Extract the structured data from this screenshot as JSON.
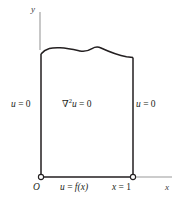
{
  "figure": {
    "type": "boundary-value-problem-diagram",
    "colors": {
      "background": "#ffffff",
      "boundary": "#231f20",
      "axis": "#9a9a9a",
      "text": "#231f20",
      "node_fill": "#ffffff"
    }
  },
  "labels": {
    "y_axis": "y",
    "x_axis": "x",
    "origin": "O",
    "left_boundary": {
      "lhs": "u",
      "op": " = ",
      "rhs": "0"
    },
    "right_boundary": {
      "lhs": "u",
      "op": " = ",
      "rhs": "0"
    },
    "interior": {
      "nabla": "∇",
      "power": "2",
      "lhs": "u",
      "op": " = ",
      "rhs": "0"
    },
    "bottom_boundary": {
      "lhs": "u",
      "op": " = ",
      "rhs": "f(x)"
    },
    "right_edge_value": {
      "lhs": "x",
      "op": " = ",
      "rhs": "1"
    }
  },
  "geometry": {
    "left_wall_x": 41,
    "right_wall_x": 133,
    "bottom_y": 177,
    "top_curve_path": "M 41 54 C 46 48, 52 47.5, 60 47.8 C 68 48.1, 74 49.6, 80 51.0 C 84 51.9, 88 51.0, 92 48.6 C 95 46.9, 98 46.6, 101 48.0 C 108 51.2, 118 55.2, 126.5 56.8 L 133 57.4",
    "y_axis": {
      "x": 40,
      "y_top": 12,
      "y_bottom": 50
    },
    "x_axis": {
      "y": 177,
      "x_left": 133,
      "x_right": 172
    },
    "nodes": [
      {
        "name": "origin-node",
        "cx": 41,
        "cy": 177,
        "r": 2.6
      },
      {
        "name": "x-equals-one-node",
        "cx": 133,
        "cy": 177,
        "r": 2.6
      }
    ]
  }
}
